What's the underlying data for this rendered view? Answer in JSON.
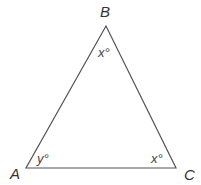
{
  "diagram": {
    "type": "triangle",
    "stroke_color": "#555555",
    "vertices": [
      {
        "name": "B",
        "x": 106,
        "y": 26,
        "label": "B",
        "angle_label": "x°"
      },
      {
        "name": "A",
        "x": 26,
        "y": 168,
        "label": "A",
        "angle_label": "y°"
      },
      {
        "name": "C",
        "x": 176,
        "y": 168,
        "label": "C",
        "angle_label": "x°"
      }
    ]
  }
}
